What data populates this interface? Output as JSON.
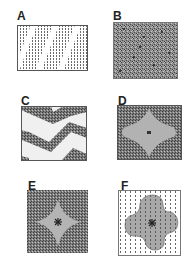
{
  "figure": {
    "panels": [
      {
        "id": "A",
        "label": "A",
        "description": "diagonal stripes of stippled texture on white"
      },
      {
        "id": "B",
        "label": "B",
        "description": "uniform dense random texture"
      },
      {
        "id": "C",
        "label": "C",
        "description": "zigzag bands of dense texture on light background"
      },
      {
        "id": "D",
        "label": "D",
        "description": "gray four-lobed star region with center mark inside dense texture"
      },
      {
        "id": "E",
        "label": "E",
        "description": "gray concave four-pointed star with asterisk center inside dense texture"
      },
      {
        "id": "F",
        "label": "F",
        "description": "gray rounded cross shape with asterisk center over grid of dots"
      }
    ],
    "colors": {
      "border": "#555555",
      "texture_dark": "#4a4a4a",
      "texture_mid": "#8a8a8a",
      "shape_gray": "#b4b4b4",
      "light_bg": "#f0f0f0",
      "dot": "#666666"
    }
  }
}
